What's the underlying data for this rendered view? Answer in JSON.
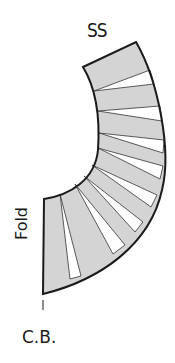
{
  "diagram": {
    "type": "sewing-pattern-piece",
    "labels": {
      "top_edge": "SS",
      "left_edge": "Fold",
      "bottom": "C.B."
    },
    "colors": {
      "fill": "#d4d4d4",
      "outline": "#1a1a1a",
      "wedge_gap": "#ffffff",
      "background": "#ffffff"
    },
    "section_count": 10
  }
}
